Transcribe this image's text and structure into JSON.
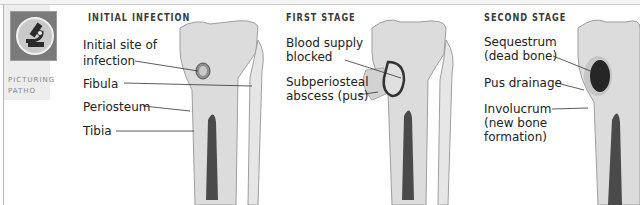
{
  "logo": {
    "line1": "PICTURING",
    "line2": "PATHO",
    "icon": "microscope-icon"
  },
  "stages": [
    {
      "title": "INITIAL INFECTION",
      "labels": [
        "Initial site of",
        "infection",
        "Fibula",
        "Periosteum",
        "Tibia"
      ]
    },
    {
      "title": "FIRST STAGE",
      "labels": [
        "Blood supply",
        "blocked",
        "Subperiosteal",
        "abscess (pus)"
      ]
    },
    {
      "title": "SECOND STAGE",
      "labels": [
        "Sequestrum",
        "(dead bone)",
        "Pus drainage",
        "Involucrum",
        "(new bone",
        "formation)"
      ]
    }
  ],
  "colors": {
    "bone": "#d9d9d9",
    "bone_outline": "#9e9e9e",
    "marrow": "#4a4a4a",
    "lesion": "#2a2a2a"
  }
}
